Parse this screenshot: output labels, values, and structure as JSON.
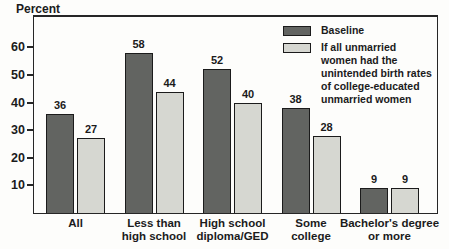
{
  "chart_data": {
    "type": "bar",
    "title": "",
    "ylabel": "Percent",
    "xlabel": "",
    "categories": [
      "All",
      "Less than high school",
      "High school diploma/GED",
      "Some college",
      "Bachelor's degree or more"
    ],
    "category_lines": [
      [
        "All"
      ],
      [
        "Less than",
        "high school"
      ],
      [
        "High school",
        "diploma/GED"
      ],
      [
        "Some",
        "college"
      ],
      [
        "Bachelor's degree",
        "or more"
      ]
    ],
    "series": [
      {
        "name": "Baseline",
        "color": "#626461",
        "values": [
          36,
          58,
          52,
          38,
          9
        ]
      },
      {
        "name": "If all unmarried women had the unintended birth rates of college-educated unmarried women",
        "color": "#d6d7d1",
        "values": [
          27,
          44,
          40,
          28,
          9
        ]
      }
    ],
    "yticks": [
      10,
      20,
      30,
      40,
      50,
      60
    ],
    "ylim": [
      0,
      71
    ],
    "grid": false,
    "legend_position": "top-right",
    "bar_border_color": "#1b1b1b",
    "axis_color": "#262626"
  }
}
